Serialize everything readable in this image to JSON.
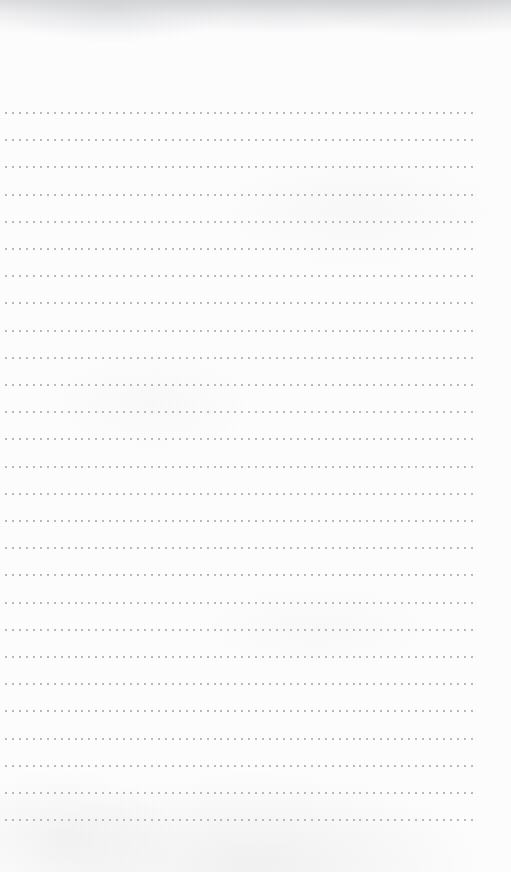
{
  "page": {
    "name": "dotted-grid-notebook-page",
    "width": 511,
    "height": 872,
    "paper_color": "#fdfdfd",
    "background_color": "#ffffff",
    "text_content": "",
    "orientation": "portrait"
  },
  "grid": {
    "name": "dot-grid",
    "dot_color": "#b9babf",
    "faint_dot_color": "#dedee2",
    "dot_size_px": 2,
    "column_spacing_px": 6.95,
    "row_spacing_px": 27.2,
    "first_row_y_px": 112,
    "last_row_y_px": 833,
    "first_column_x_px": 5,
    "last_column_x_px": 470,
    "row_count": 27,
    "column_count": 68,
    "top_margin_px": 112,
    "bottom_margin_px": 38,
    "left_margin_px": 5,
    "right_margin_px": 41
  },
  "texture": {
    "name": "paper-texture",
    "top_edge_shadow_color": "#9ea0a7",
    "top_edge_shadow_height_px": 34,
    "grain_color": "#96989e",
    "mottle_color": "#b0b2b8"
  }
}
